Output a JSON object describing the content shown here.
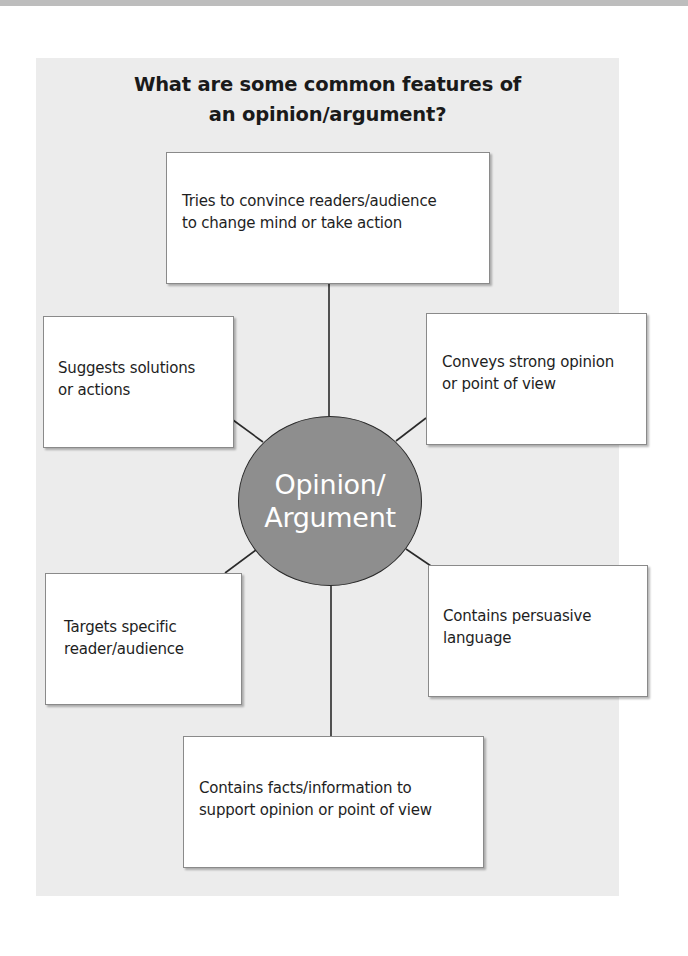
{
  "diagram": {
    "title_line1": "What are some common features of",
    "title_line2": "an opinion/argument?",
    "center": {
      "line1": "Opinion/",
      "line2": "Argument"
    },
    "features": [
      {
        "id": "top",
        "line1": "Tries to convince readers/audience",
        "line2": "to change mind or take action"
      },
      {
        "id": "upper-left",
        "line1": "Suggests solutions",
        "line2": "or actions"
      },
      {
        "id": "upper-right",
        "line1": "Conveys strong opinion",
        "line2": "or point of view"
      },
      {
        "id": "lower-left",
        "line1": "Targets specific",
        "line2": "reader/audience"
      },
      {
        "id": "lower-right",
        "line1": "Contains persuasive",
        "line2": "language"
      },
      {
        "id": "bottom",
        "line1": "Contains facts/information to",
        "line2": "support opinion or point of view"
      }
    ],
    "colors": {
      "panel_background": "#ececec",
      "center_fill": "#8e8e8e",
      "center_text": "#ffffff",
      "box_border": "#8a8a8a",
      "connector": "#2a2a2a"
    }
  }
}
